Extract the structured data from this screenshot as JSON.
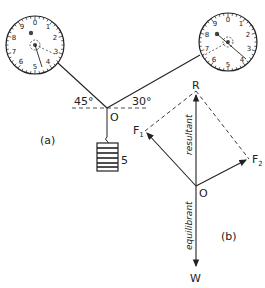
{
  "diagram": {
    "part_a": {
      "label": "(a)",
      "angle_left": "45°",
      "angle_right": "30°",
      "point": "O",
      "weight_value": "5",
      "left_dial": {
        "numbers": [
          "0",
          "1",
          "2",
          "3",
          "4",
          "5",
          "6",
          "7",
          "8",
          "9"
        ],
        "reading": "4.5"
      },
      "right_dial": {
        "numbers": [
          "0",
          "1",
          "2",
          "3",
          "4",
          "5",
          "6",
          "7",
          "8",
          "9"
        ],
        "reading": "4"
      }
    },
    "part_b": {
      "label": "(b)",
      "point": "O",
      "resultant_point": "R",
      "force1": "F",
      "force1_sub": "1",
      "force2": "F",
      "force2_sub": "2",
      "weight": "W",
      "resultant_label": "resultant",
      "equilibrant_label": "equilibrant"
    }
  }
}
